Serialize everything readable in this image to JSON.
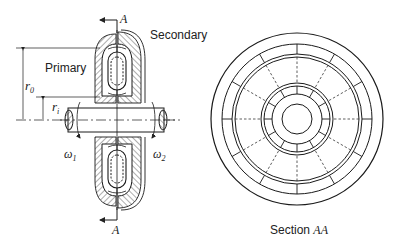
{
  "figure": {
    "left_view": {
      "section_marker_top": "A",
      "section_marker_bottom": "A",
      "label_secondary": "Secondary",
      "label_primary": "Primary",
      "dim_outer_radius": {
        "symbol": "r",
        "subscript": "0"
      },
      "dim_inner_radius": {
        "symbol": "r",
        "subscript": "i"
      },
      "omega_input": {
        "symbol": "ω",
        "subscript": "1"
      },
      "omega_output": {
        "symbol": "ω",
        "subscript": "2"
      }
    },
    "right_view": {
      "caption_prefix": "Section ",
      "caption_italic": "AA",
      "radial_divisions": 12
    }
  },
  "colors": {
    "line": "#1a1a1a",
    "hatch": "#333333",
    "background": "#ffffff"
  }
}
